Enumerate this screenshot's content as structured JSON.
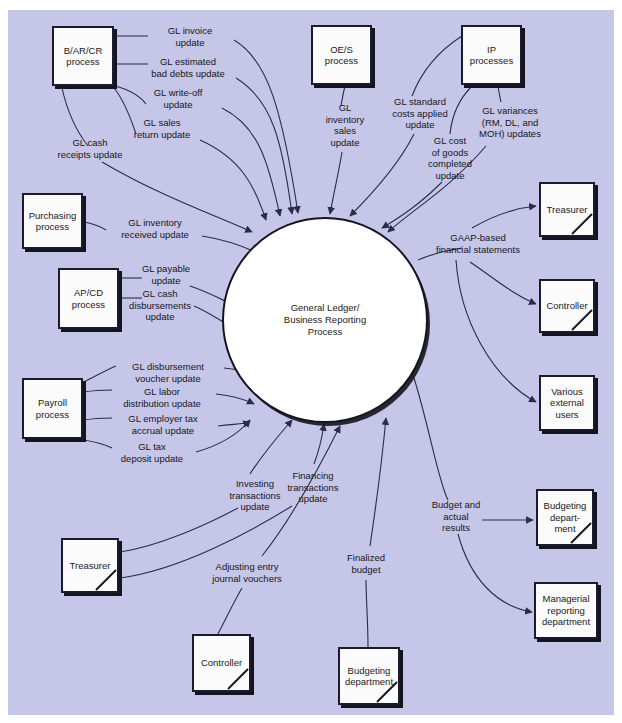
{
  "diagram": {
    "title_fragment": "",
    "background_color": "#c6c6e8",
    "entity_fill": "#fbfbfb",
    "line_color": "#2b2b4a",
    "process": {
      "label": "General Ledger/\nBusiness Reporting\nProcess"
    },
    "entities": [
      {
        "id": "bar-cr-process",
        "label": "B/AR/CR\nprocess",
        "x": 52,
        "y": 26,
        "w": 62,
        "h": 60,
        "slash": false
      },
      {
        "id": "oe-s-process",
        "label": "OE/S\nprocess",
        "x": 311,
        "y": 25,
        "w": 61,
        "h": 60,
        "slash": false
      },
      {
        "id": "ip-processes",
        "label": "IP\nprocesses",
        "x": 461,
        "y": 25,
        "w": 61,
        "h": 60,
        "slash": false
      },
      {
        "id": "purchasing-process",
        "label": "Purchasing\nprocess",
        "x": 22,
        "y": 193,
        "w": 61,
        "h": 56,
        "slash": false
      },
      {
        "id": "ap-cd-process",
        "label": "AP/CD\nprocess",
        "x": 58,
        "y": 268,
        "w": 61,
        "h": 61,
        "slash": false
      },
      {
        "id": "payroll-process",
        "label": "Payroll\nprocess",
        "x": 22,
        "y": 378,
        "w": 61,
        "h": 61,
        "slash": false
      },
      {
        "id": "treasurer-left",
        "label": "Treasurer",
        "x": 61,
        "y": 538,
        "w": 58,
        "h": 55,
        "slash": true
      },
      {
        "id": "controller-bottom",
        "label": "Controller",
        "x": 192,
        "y": 634,
        "w": 59,
        "h": 58,
        "slash": true
      },
      {
        "id": "budgeting-department-bottom",
        "label": "Budgeting\ndepartment",
        "x": 338,
        "y": 647,
        "w": 62,
        "h": 58,
        "slash": true
      },
      {
        "id": "treasurer-right",
        "label": "Treasurer",
        "x": 539,
        "y": 182,
        "w": 56,
        "h": 55,
        "slash": true
      },
      {
        "id": "controller-right",
        "label": "Controller",
        "x": 539,
        "y": 279,
        "w": 56,
        "h": 54,
        "slash": true
      },
      {
        "id": "various-external-users",
        "label": "Various\nexternal\nusers",
        "x": 539,
        "y": 375,
        "w": 56,
        "h": 56,
        "slash": false
      },
      {
        "id": "budgeting-department-right",
        "label": "Budgeting\ndepart-\nment",
        "x": 536,
        "y": 489,
        "w": 58,
        "h": 57,
        "slash": true
      },
      {
        "id": "managerial-reporting-department",
        "label": "Managerial\nreporting\ndepartment",
        "x": 534,
        "y": 582,
        "w": 64,
        "h": 57,
        "slash": false
      }
    ],
    "flows": [
      {
        "id": "gl-invoice-update",
        "label": "GL invoice\nupdate",
        "lx": 190,
        "ly": 36,
        "source": "bar-cr-process",
        "target": "process"
      },
      {
        "id": "gl-estimated-bad-debts-update",
        "label": "GL estimated\nbad debts update",
        "lx": 188,
        "ly": 67,
        "source": "bar-cr-process",
        "target": "process"
      },
      {
        "id": "gl-write-off-update",
        "label": "GL write-off\nupdate",
        "lx": 178,
        "ly": 98,
        "source": "bar-cr-process",
        "target": "process"
      },
      {
        "id": "gl-sales-return-update",
        "label": "GL sales\nreturn update",
        "lx": 162,
        "ly": 128,
        "source": "bar-cr-process",
        "target": "process"
      },
      {
        "id": "gl-cash-receipts-update",
        "label": "GL cash\nreceipts update",
        "lx": 90,
        "ly": 148,
        "source": "bar-cr-process",
        "target": "process"
      },
      {
        "id": "gl-inventory-sales-update",
        "label": "GL\ninventory\nsales\nupdate",
        "lx": 345,
        "ly": 125,
        "source": "oe-s-process",
        "target": "process"
      },
      {
        "id": "gl-standard-costs-applied-update",
        "label": "GL standard\ncosts applied\nupdate",
        "lx": 420,
        "ly": 113,
        "source": "ip-processes",
        "target": "process"
      },
      {
        "id": "gl-variances-updates",
        "label": "GL variances\n(RM, DL, and\nMOH) updates",
        "lx": 510,
        "ly": 122,
        "source": "ip-processes",
        "target": "process"
      },
      {
        "id": "gl-cost-of-goods-completed-update",
        "label": "GL cost\nof goods\ncompleted\nupdate",
        "lx": 450,
        "ly": 158,
        "source": "ip-processes",
        "target": "process"
      },
      {
        "id": "gl-inventory-received-update",
        "label": "GL inventory\nreceived update",
        "lx": 155,
        "ly": 228,
        "source": "purchasing-process",
        "target": "process"
      },
      {
        "id": "gl-payable-update",
        "label": "GL payable\nupdate",
        "lx": 166,
        "ly": 274,
        "source": "ap-cd-process",
        "target": "process"
      },
      {
        "id": "gl-cash-disbursements-update",
        "label": "GL cash\ndisbursements\nupdate",
        "lx": 160,
        "ly": 305,
        "source": "ap-cd-process",
        "target": "process"
      },
      {
        "id": "gl-disbursement-voucher-update",
        "label": "GL disbursement\nvoucher update",
        "lx": 168,
        "ly": 372,
        "source": "payroll-process",
        "target": "process"
      },
      {
        "id": "gl-labor-distribution-update",
        "label": "GL labor\ndistribution update",
        "lx": 162,
        "ly": 397,
        "source": "payroll-process",
        "target": "process"
      },
      {
        "id": "gl-employer-tax-accrual-update",
        "label": "GL employer tax\naccrual update",
        "lx": 163,
        "ly": 424,
        "source": "payroll-process",
        "target": "process"
      },
      {
        "id": "gl-tax-deposit-update",
        "label": "GL tax\ndeposit update",
        "lx": 152,
        "ly": 452,
        "source": "payroll-process",
        "target": "process"
      },
      {
        "id": "investing-transactions-update",
        "label": "Investing\ntransactions\nupdate",
        "lx": 255,
        "ly": 495,
        "source": "treasurer-left",
        "target": "process"
      },
      {
        "id": "financing-transactions-update",
        "label": "Financing\ntransactions\nupdate",
        "lx": 313,
        "ly": 487,
        "source": "treasurer-left",
        "target": "process"
      },
      {
        "id": "adjusting-entry-journal-vouchers",
        "label": "Adjusting entry\njournal vouchers",
        "lx": 247,
        "ly": 572,
        "source": "controller-bottom",
        "target": "process"
      },
      {
        "id": "finalized-budget",
        "label": "Finalized\nbudget",
        "lx": 366,
        "ly": 563,
        "source": "budgeting-department-bottom",
        "target": "process"
      },
      {
        "id": "gaap-based-financial-statements",
        "label": "GAAP-based\nfinancial statements",
        "lx": 478,
        "ly": 243,
        "source": "process",
        "target": "treasurer-right"
      },
      {
        "id": "budget-and-actual-results",
        "label": "Budget and\nactual\nresults",
        "lx": 456,
        "ly": 516,
        "source": "process",
        "target": "budgeting-department-right"
      }
    ]
  }
}
